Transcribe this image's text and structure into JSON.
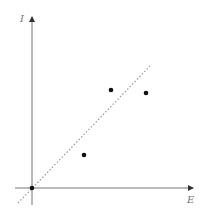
{
  "chart_data": {
    "type": "scatter",
    "title": "",
    "xlabel": "E",
    "ylabel": "I",
    "grid": false,
    "legend": null,
    "points": [
      {
        "x": 0,
        "y": 0,
        "px": 32,
        "py": 188
      },
      {
        "x": 52,
        "y": 159,
        "px": 84,
        "py": 155
      },
      {
        "x": 79,
        "y": 99,
        "px": 111,
        "py": 90
      },
      {
        "x": 114,
        "y": 95,
        "px": 146,
        "py": 93
      }
    ],
    "fit_line": {
      "style": "dotted",
      "from": {
        "px": 18,
        "py": 203
      },
      "to": {
        "px": 150,
        "py": 66
      }
    },
    "axes": {
      "origin_px": [
        32,
        188
      ],
      "x_axis": {
        "from_px": 15,
        "to_px": 193,
        "arrow": true
      },
      "y_axis": {
        "from_py": 205,
        "to_py": 17,
        "arrow": true
      }
    },
    "colors": {
      "axis": "#777777",
      "point": "#111111",
      "line": "#999999"
    }
  }
}
